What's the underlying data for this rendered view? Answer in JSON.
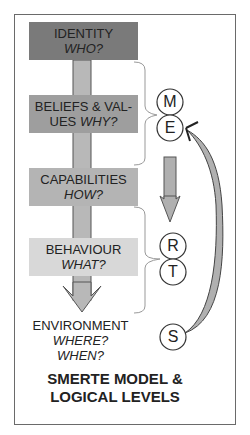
{
  "levels": [
    {
      "label": "IDENTITY",
      "question": "WHO?",
      "color": "#7a7a7a"
    },
    {
      "label": "BELIEFS & VAL-",
      "label2": "UES",
      "question": "WHY?",
      "color": "#9e9e9e"
    },
    {
      "label": "CAPABILITIES",
      "question": "HOW?",
      "color": "#b4b4b4"
    },
    {
      "label": "BEHAVIOUR",
      "question": "WHAT?",
      "color": "#d8d8d8"
    },
    {
      "label": "ENVIRONMENT",
      "question": "WHERE?",
      "question2": "WHEN?"
    }
  ],
  "circles": [
    {
      "letter": "M"
    },
    {
      "letter": "E"
    },
    {
      "letter": "R"
    },
    {
      "letter": "T"
    },
    {
      "letter": "S"
    }
  ],
  "title": {
    "line1": "SMERTE MODEL &",
    "line2": "LOGICAL LEVELS"
  },
  "colors": {
    "arrow_fill": "#b0b0b0",
    "arrow_stroke": "#555555",
    "frame": "#6a6a6a",
    "brace": "#999999"
  }
}
